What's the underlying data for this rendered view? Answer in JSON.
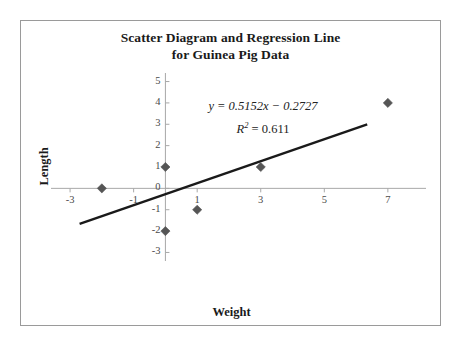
{
  "chart_data": {
    "type": "scatter",
    "title": "Scatter Diagram and Regression Line for Guinea Pig Data",
    "title_line1": "Scatter Diagram and Regression Line",
    "title_line2": "for Guinea Pig Data",
    "xlabel": "Weight",
    "ylabel": "Length",
    "points": [
      {
        "x": -2,
        "y": 0
      },
      {
        "x": 0,
        "y": 1
      },
      {
        "x": 0,
        "y": -2
      },
      {
        "x": 1,
        "y": -1
      },
      {
        "x": 3,
        "y": 1
      },
      {
        "x": 7,
        "y": 4
      }
    ],
    "x": [
      -2,
      0,
      0,
      1,
      3,
      7
    ],
    "y": [
      0,
      1,
      -2,
      -1,
      1,
      4
    ],
    "xlim": [
      -3.6,
      8.2
    ],
    "ylim": [
      -3.4,
      5.4
    ],
    "xticks": [
      -3,
      -1,
      1,
      3,
      5,
      7
    ],
    "xtick_labels": [
      "-3",
      "-1",
      "1",
      "3",
      "5",
      "7"
    ],
    "yticks": [
      -3,
      -2,
      -1,
      0,
      1,
      2,
      3,
      4,
      5
    ],
    "ytick_labels": [
      "-3",
      "-2",
      "-1",
      "0",
      "1",
      "2",
      "3",
      "4",
      "5"
    ],
    "grid": false,
    "legend": "none",
    "marker": "diamond",
    "marker_color": "#555555",
    "axis_color": "#a8a8a8",
    "line_color": "#1a1a1a",
    "frame_color": "#9a9a9a",
    "trendline": {
      "type": "linear",
      "slope": 0.5152,
      "intercept": -0.2727,
      "r_squared": 0.611,
      "x_start": -2.7,
      "x_end": 6.35,
      "equation_text": "y = 0.5152x − 0.2727",
      "r2_prefix": "R",
      "r2_exponent": "2",
      "r2_value": " = 0.611"
    },
    "annotations": [
      "y = 0.5152x − 0.2727",
      "R² = 0.611"
    ]
  }
}
